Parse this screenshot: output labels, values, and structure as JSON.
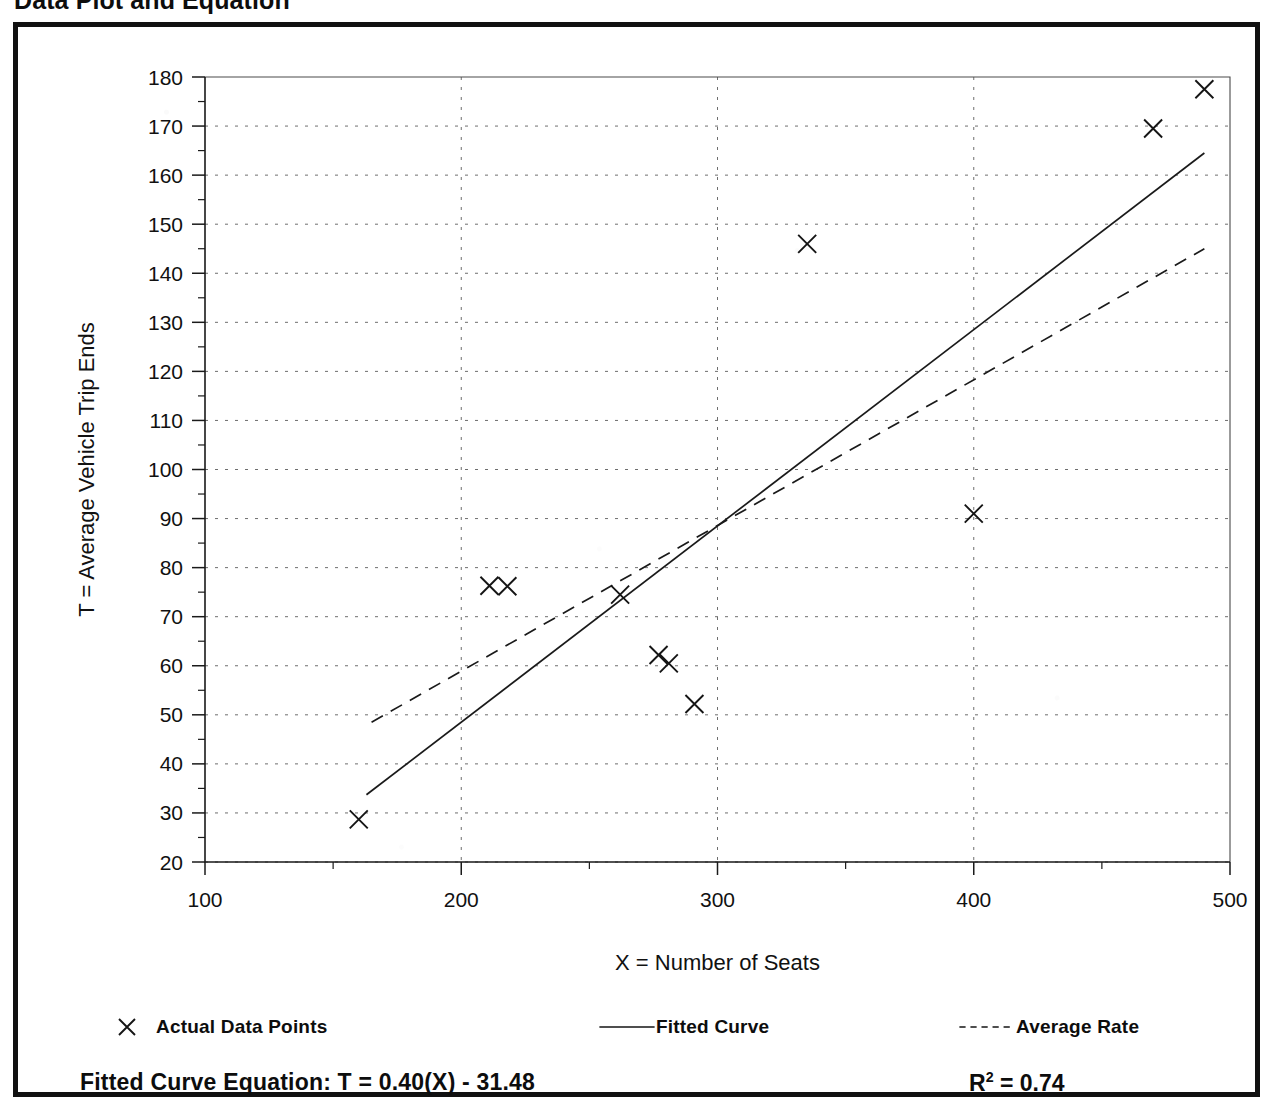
{
  "page_title": "Data Plot and Equation",
  "chart_data": {
    "type": "scatter",
    "title": "Data Plot and Equation",
    "xlabel": "X = Number of Seats",
    "ylabel": "T = Average Vehicle Trip Ends",
    "xlim": [
      100,
      500
    ],
    "ylim": [
      20,
      180
    ],
    "x_major_ticks": [
      100,
      200,
      300,
      400,
      500
    ],
    "x_minor_step": 50,
    "y_major_ticks": [
      20,
      30,
      40,
      50,
      60,
      70,
      80,
      90,
      100,
      110,
      120,
      130,
      140,
      150,
      160,
      170,
      180
    ],
    "y_minor_step": 5,
    "grid": true,
    "legend_position": "below-plot",
    "series": [
      {
        "name": "Actual Data Points",
        "type": "scatter",
        "marker": "x",
        "points": [
          [
            160,
            28.7
          ],
          [
            211,
            76.3
          ],
          [
            218,
            76.2
          ],
          [
            262,
            74.5
          ],
          [
            277,
            62.2
          ],
          [
            281,
            60.5
          ],
          [
            291,
            52.2
          ],
          [
            335,
            146.0
          ],
          [
            400,
            91.0
          ],
          [
            470,
            169.5
          ],
          [
            490,
            177.5
          ]
        ]
      },
      {
        "name": "Fitted Curve",
        "type": "line",
        "style": "solid",
        "equation": "T = 0.40(X) - 31.48",
        "slope": 0.4,
        "intercept": -31.48,
        "x_range": [
          163,
          490
        ],
        "endpoints": [
          [
            163,
            33.7
          ],
          [
            490,
            164.5
          ]
        ]
      },
      {
        "name": "Average Rate",
        "type": "line",
        "style": "dashed",
        "x_range": [
          165,
          490
        ],
        "endpoints": [
          [
            165,
            48.5
          ],
          [
            490,
            145.0
          ]
        ]
      }
    ],
    "annotations": {
      "equation_label": "Fitted Curve Equation:",
      "equation_value": "T = 0.40(X) - 31.48",
      "r_squared_label": "R",
      "r_squared_exponent": "2",
      "r_squared_value": "= 0.74"
    }
  },
  "legend": [
    {
      "label": "Actual Data Points",
      "glyph": "x-marker"
    },
    {
      "label": "Fitted Curve",
      "glyph": "solid-line"
    },
    {
      "label": "Average Rate",
      "glyph": "dashed-line"
    }
  ],
  "footer": {
    "equation": "Fitted Curve Equation:  T = 0.40(X) - 31.48",
    "r_squared_prefix": "R",
    "r_squared_sup": "2",
    "r_squared_suffix": " = 0.74"
  }
}
